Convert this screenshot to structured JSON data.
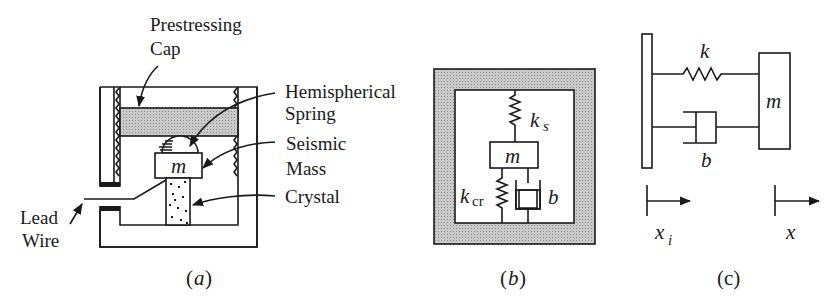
{
  "figure": {
    "panel_a": {
      "caption_open": "(",
      "caption_letter": "a",
      "caption_close": ")",
      "labels": {
        "prestressing_line1": "Prestressing",
        "prestressing_line2": "Cap",
        "hemispherical_line1": "Hemispherical",
        "hemispherical_line2": "Spring",
        "seismic_line1": "Seismic",
        "seismic_line2": "Mass",
        "crystal": "Crystal",
        "lead_line1": "Lead",
        "lead_line2": "Wire",
        "mass": "m"
      }
    },
    "panel_b": {
      "caption_open": "(",
      "caption_letter": "b",
      "caption_close": ")",
      "labels": {
        "ks_main": "k",
        "ks_sub": "s",
        "kcr_main": "k",
        "kcr_sub": "cr",
        "mass": "m",
        "damper": "b"
      }
    },
    "panel_c": {
      "caption": "(c)",
      "labels": {
        "spring": "k",
        "mass": "m",
        "damper": "b",
        "xi_main": "x",
        "xi_sub": "i",
        "x": "x"
      }
    },
    "colors": {
      "ink": "#1a1a1a",
      "hatch": "#bdbdbd",
      "background": "#ffffff"
    }
  }
}
